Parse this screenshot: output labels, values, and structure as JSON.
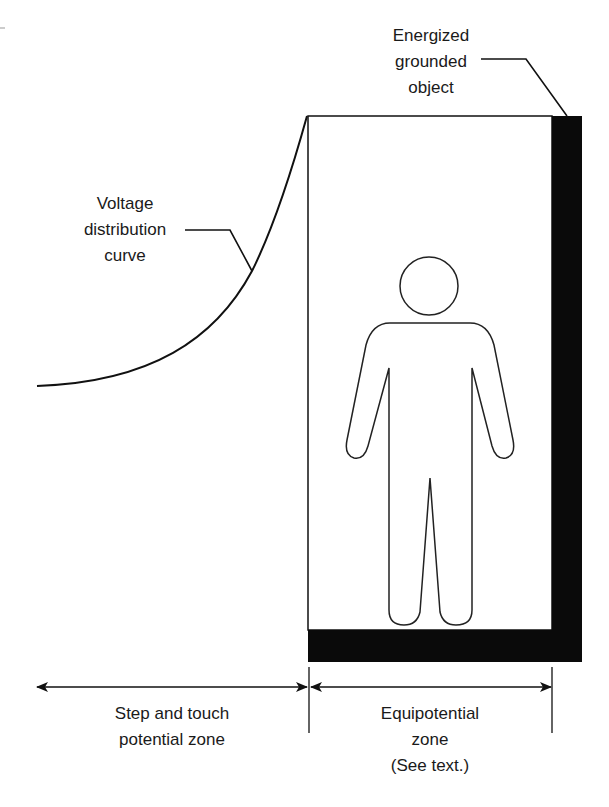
{
  "diagram": {
    "type": "equipotential-zone-illustration",
    "colors": {
      "ink": "#111111",
      "background": "#ffffff"
    },
    "labels": {
      "energized_object": [
        "Energized",
        "grounded",
        "object"
      ],
      "voltage_curve": [
        "Voltage",
        "distribution",
        "curve"
      ],
      "step_touch_zone": [
        "Step and touch",
        "potential zone"
      ],
      "equipotential_zone": [
        "Equipotential",
        "zone",
        "(See text.)"
      ]
    },
    "elements": {
      "energized_object": "L-shaped black bar (right side and bottom of equipotential box)",
      "voltage_curve": "exponential rise from left to top-left corner of box",
      "person": "outlined human figure standing inside equipotential zone",
      "dimension_arrows": [
        "step-and-touch potential zone (left)",
        "equipotential zone (right)"
      ]
    }
  }
}
